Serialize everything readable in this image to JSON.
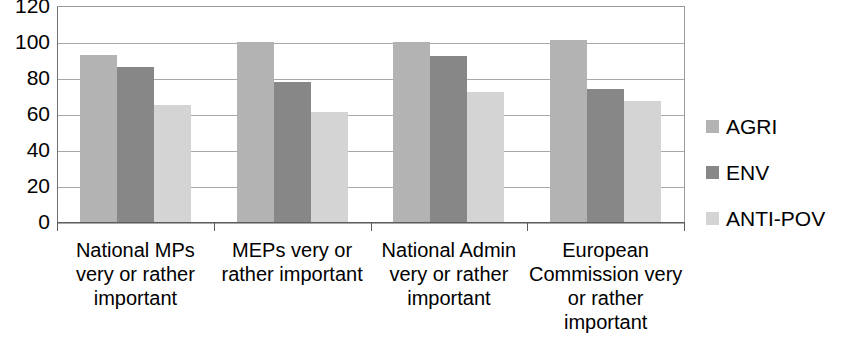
{
  "chart_data": {
    "type": "bar",
    "title": "",
    "xlabel": "",
    "ylabel": "",
    "ylim": [
      0,
      120
    ],
    "yticks": [
      0,
      20,
      40,
      60,
      80,
      100,
      120
    ],
    "ytick_labels": [
      "0",
      "20",
      "40",
      "60",
      "80",
      "100",
      "120"
    ],
    "grid": true,
    "legend_position": "right",
    "categories": [
      "National MPs very or rather important",
      "MEPs very or rather important",
      "National Admin very or rather important",
      "European Commission very or rather important"
    ],
    "category_lines": [
      [
        "National MPs",
        "very or rather",
        "important"
      ],
      [
        "MEPs very or",
        "rather important"
      ],
      [
        "National Admin",
        "very or rather",
        "important"
      ],
      [
        "European",
        "Commission very",
        "or rather",
        "important"
      ]
    ],
    "series": [
      {
        "name": "AGRI",
        "color": "#b3b3b3",
        "values": [
          93,
          100,
          100,
          101
        ]
      },
      {
        "name": "ENV",
        "color": "#878787",
        "values": [
          86,
          78,
          92,
          74
        ]
      },
      {
        "name": "ANTI-POV",
        "color": "#d4d4d4",
        "values": [
          65,
          61,
          72,
          67
        ]
      }
    ]
  },
  "legend": {
    "items": [
      {
        "label": "AGRI",
        "swatch_color": "#b3b3b3"
      },
      {
        "label": "ENV",
        "swatch_color": "#878787"
      },
      {
        "label": "ANTI-POV",
        "swatch_color": "#d4d4d4"
      }
    ]
  }
}
